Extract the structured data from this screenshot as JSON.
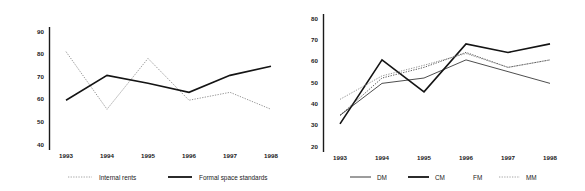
{
  "figure": {
    "name": "two-panel-line-chart-figure",
    "background": "#ffffff",
    "text_color": "#1a1a1a"
  },
  "chart_data": [
    {
      "id": "left",
      "type": "line",
      "title": "",
      "subtitle": "",
      "xlabel": "",
      "ylabel": "",
      "categories": [
        "1993",
        "1994",
        "1995",
        "1996",
        "1997",
        "1998"
      ],
      "ylim": [
        40,
        90
      ],
      "yticks": [
        40,
        50,
        60,
        70,
        80,
        90
      ],
      "grid": false,
      "legend_position": "bottom",
      "series": [
        {
          "name": "Internal rents",
          "style": "dotted",
          "color": "#8a8a8a",
          "values": [
            81,
            55.5,
            78,
            59.5,
            63,
            55.5
          ]
        },
        {
          "name": "Formal space standards",
          "style": "solid",
          "color": "#141414",
          "values": [
            59.5,
            70.5,
            67,
            63,
            70.5,
            74.5
          ]
        }
      ]
    },
    {
      "id": "right",
      "type": "line",
      "title": "",
      "subtitle": "",
      "xlabel": "",
      "ylabel": "",
      "categories": [
        "1993",
        "1994",
        "1995",
        "1996",
        "1997",
        "1998"
      ],
      "ylim": [
        20,
        80
      ],
      "yticks": [
        20,
        30,
        40,
        50,
        60,
        70,
        80
      ],
      "grid": false,
      "legend_position": "bottom",
      "series": [
        {
          "name": "DM",
          "style": "thin",
          "color": "#3a3a3a",
          "values": [
            34.5,
            49.5,
            52,
            60.5,
            55,
            49.5
          ]
        },
        {
          "name": "CM",
          "style": "solid",
          "color": "#141414",
          "values": [
            30.5,
            60.5,
            45.5,
            68,
            64,
            68
          ]
        },
        {
          "name": "FM",
          "style": "dotted-dark",
          "color": "#4a4a4a",
          "values": [
            34.5,
            52,
            57,
            64,
            57,
            60.5
          ]
        },
        {
          "name": "MM",
          "style": "dotted",
          "color": "#9a9a9a",
          "values": [
            42,
            53,
            58,
            63.5,
            57,
            60.5
          ]
        }
      ]
    }
  ],
  "left_chart": {
    "yticks": [
      "90",
      "80",
      "70",
      "60",
      "50",
      "40"
    ],
    "xticks": [
      "1993",
      "1994",
      "1995",
      "1996",
      "1997",
      "1998"
    ],
    "legend": [
      {
        "label": "Internal rents",
        "icon": "dotted-line-swatch"
      },
      {
        "label": "Formal space standards",
        "icon": "solid-line-swatch"
      }
    ]
  },
  "right_chart": {
    "yticks": [
      "80",
      "70",
      "60",
      "50",
      "40",
      "30",
      "20"
    ],
    "xticks": [
      "1993",
      "1994",
      "1995",
      "1996",
      "1997",
      "1998"
    ],
    "legend": [
      {
        "label": "DM",
        "icon": "thin-line-swatch"
      },
      {
        "label": "CM",
        "icon": "solid-line-swatch"
      },
      {
        "label": "FM",
        "icon": "faint-line-swatch"
      },
      {
        "label": "MM",
        "icon": "dotted-line-swatch"
      }
    ]
  }
}
